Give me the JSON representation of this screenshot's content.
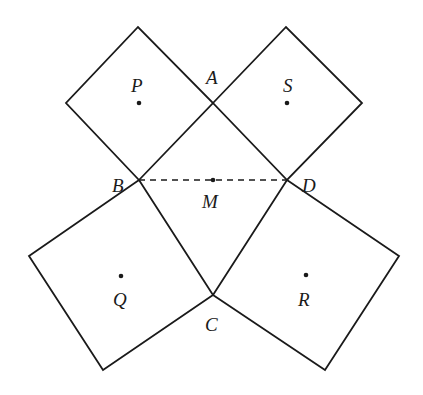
{
  "diagram": {
    "squares": [
      {
        "name": "P",
        "points": [
          [
            139,
            180
          ],
          [
            213,
            103
          ],
          [
            138,
            27
          ],
          [
            66,
            103
          ]
        ],
        "center": [
          139,
          103
        ],
        "label_pos": [
          131,
          92
        ]
      },
      {
        "name": "S",
        "points": [
          [
            213,
            103
          ],
          [
            286,
            27
          ],
          [
            362,
            103
          ],
          [
            287,
            180
          ]
        ],
        "center": [
          287,
          103
        ],
        "label_pos": [
          284,
          92
        ]
      },
      {
        "name": "Q",
        "points": [
          [
            139,
            180
          ],
          [
            213,
            295
          ],
          [
            103,
            370
          ],
          [
            29,
            256
          ]
        ],
        "center": [
          121,
          276
        ],
        "label_pos": [
          114,
          306
        ]
      },
      {
        "name": "R",
        "points": [
          [
            213,
            295
          ],
          [
            287,
            180
          ],
          [
            399,
            256
          ],
          [
            325,
            370
          ]
        ],
        "center": [
          306,
          275
        ],
        "label_pos": [
          298,
          306
        ]
      }
    ],
    "vertices": {
      "A": {
        "pos": [
          213,
          103
        ],
        "label": "A",
        "label_pos": [
          206,
          84
        ]
      },
      "B": {
        "pos": [
          139,
          180
        ],
        "label": "B",
        "label_pos": [
          112,
          192
        ]
      },
      "C": {
        "pos": [
          213,
          295
        ],
        "label": "C",
        "label_pos": [
          205,
          331
        ]
      },
      "D": {
        "pos": [
          287,
          180
        ],
        "label": "D",
        "label_pos": [
          302,
          192
        ]
      },
      "M": {
        "pos": [
          213,
          180
        ],
        "label": "M",
        "label_pos": [
          203,
          208
        ]
      }
    },
    "dashed_segment": {
      "from": "B",
      "to": "D"
    },
    "labels": {
      "P": "P",
      "S": "S",
      "Q": "Q",
      "R": "R",
      "A": "A",
      "B": "B",
      "C": "C",
      "D": "D",
      "M": "M"
    }
  }
}
